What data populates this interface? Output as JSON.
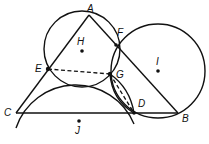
{
  "diagram": {
    "type": "geometry",
    "points": [
      {
        "name": "A",
        "label": "A"
      },
      {
        "name": "B",
        "label": "B"
      },
      {
        "name": "C",
        "label": "C"
      },
      {
        "name": "D",
        "label": "D"
      },
      {
        "name": "E",
        "label": "E"
      },
      {
        "name": "F",
        "label": "F"
      },
      {
        "name": "G",
        "label": "G"
      },
      {
        "name": "H",
        "label": "H"
      },
      {
        "name": "I",
        "label": "I"
      },
      {
        "name": "J",
        "label": "J"
      }
    ],
    "circles": [
      {
        "center": "H",
        "through": [
          "A",
          "E",
          "G",
          "F"
        ]
      },
      {
        "center": "I",
        "through": [
          "F",
          "G",
          "D",
          "B"
        ]
      },
      {
        "center": "J",
        "through": [
          "C",
          "E",
          "G",
          "D"
        ]
      }
    ],
    "segments": [
      "AC",
      "AB",
      "CB"
    ],
    "dashed_segments": [
      "EG",
      "GD"
    ],
    "colors": {
      "stroke": "#111111",
      "background": "#ffffff"
    }
  }
}
